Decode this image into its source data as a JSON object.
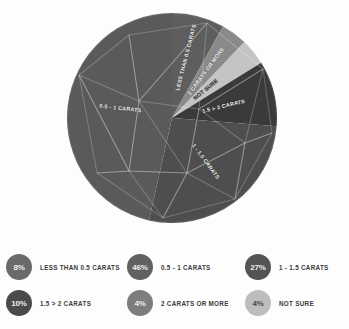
{
  "chart_data": {
    "type": "pie",
    "title": "",
    "start_angle_deg": 0,
    "direction": "clockwise",
    "legend_position": "bottom",
    "labels": [
      "LESS THAN 0.5 CARATS",
      "2 CARATS OR MORE",
      "NOT SURE",
      "1.5 > 2 CARATS",
      "1 - 1.5 CARATS",
      "0.5 - 1 CARATS"
    ],
    "values": [
      8,
      4,
      4,
      10,
      27,
      46
    ],
    "value_labels": [
      "8%",
      "4%",
      "4%",
      "10%",
      "27%",
      "46%"
    ],
    "colors": [
      "#5e5e5e",
      "#8a8a8a",
      "#c4c4c4",
      "#3a3a3a",
      "#4e4e4e",
      "#5a5a5a"
    ],
    "slices": [
      {
        "label": "LESS THAN 0.5 CARATS",
        "value": 8,
        "percent": "8%",
        "color": "#5e5e5e"
      },
      {
        "label": "2 CARATS OR MORE",
        "value": 4,
        "percent": "4%",
        "color": "#8a8a8a"
      },
      {
        "label": "NOT SURE",
        "value": 4,
        "percent": "4%",
        "color": "#c4c4c4"
      },
      {
        "label": "1.5 > 2 CARATS",
        "value": 10,
        "percent": "10%",
        "color": "#3a3a3a"
      },
      {
        "label": "1 - 1.5 CARATS",
        "value": 27,
        "percent": "27%",
        "color": "#4e4e4e"
      },
      {
        "label": "0.5 - 1 CARATS",
        "value": 46,
        "percent": "46%",
        "color": "#5a5a5a"
      }
    ]
  },
  "legend": {
    "items": [
      {
        "percent": "8%",
        "label": "LESS THAN 0.5 CARATS",
        "color": "#6a6a6a"
      },
      {
        "percent": "46%",
        "label": "0.5 - 1 CARATS",
        "color": "#616161"
      },
      {
        "percent": "27%",
        "label": "1 - 1.5 CARATS",
        "color": "#545454"
      },
      {
        "percent": "10%",
        "label": "1.5 > 2 CARATS",
        "color": "#4a4a4a"
      },
      {
        "percent": "4%",
        "label": "2 CARATS OR MORE",
        "color": "#7d7d7d"
      },
      {
        "percent": "4%",
        "label": "NOT SURE",
        "color": "#bdbdbd"
      }
    ]
  }
}
